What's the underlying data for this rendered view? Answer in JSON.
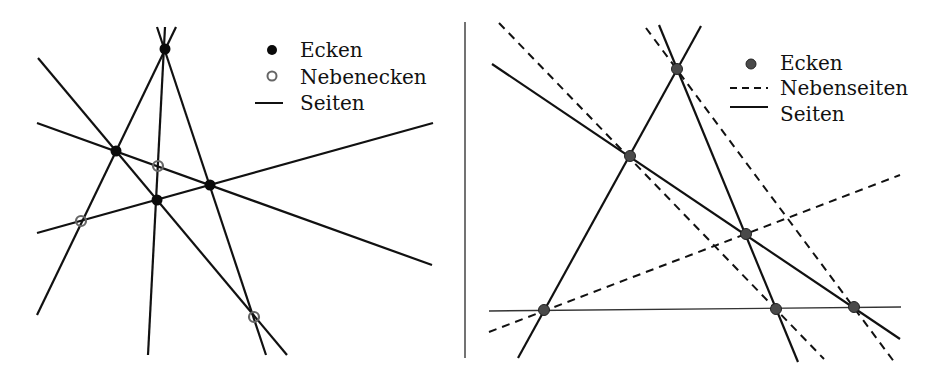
{
  "colors": {
    "line": "#111111",
    "vertex_fill_left": "#0a0a0a",
    "vertex_fill_right": "#4a4a4a",
    "vertex_stroke_right": "#222222",
    "secondary_vertex_stroke": "#666666",
    "separator": "#444444",
    "background": "#ffffff"
  },
  "left_panel": {
    "legend": {
      "items": [
        {
          "symbol": "filled-dot",
          "label": "Ecken"
        },
        {
          "symbol": "open-circle",
          "label": "Nebenecken"
        },
        {
          "symbol": "solid-line",
          "label": "Seiten"
        }
      ]
    },
    "lines": [
      {
        "x1": 38,
        "y1": 58,
        "x2": 287,
        "y2": 355,
        "style": "solid"
      },
      {
        "x1": 37,
        "y1": 123,
        "x2": 432,
        "y2": 265,
        "style": "solid"
      },
      {
        "x1": 37,
        "y1": 233,
        "x2": 433,
        "y2": 123,
        "style": "solid"
      },
      {
        "x1": 37,
        "y1": 315,
        "x2": 176,
        "y2": 27,
        "style": "solid"
      },
      {
        "x1": 148,
        "y1": 355,
        "x2": 165,
        "y2": 27,
        "style": "solid"
      },
      {
        "x1": 157,
        "y1": 27,
        "x2": 266,
        "y2": 355,
        "style": "solid"
      }
    ],
    "vertices": [
      {
        "x": 165,
        "y": 49
      },
      {
        "x": 116,
        "y": 151
      },
      {
        "x": 157,
        "y": 200
      },
      {
        "x": 210,
        "y": 185
      }
    ],
    "secondary_vertices": [
      {
        "x": 158,
        "y": 166
      },
      {
        "x": 81,
        "y": 221
      },
      {
        "x": 254,
        "y": 317
      }
    ]
  },
  "right_panel": {
    "legend": {
      "items": [
        {
          "symbol": "filled-dot",
          "label": "Ecken"
        },
        {
          "symbol": "dashed-line",
          "label": "Nebenseiten"
        },
        {
          "symbol": "solid-line",
          "label": "Seiten"
        }
      ]
    },
    "lines": [
      {
        "x1": 489,
        "y1": 311,
        "x2": 901,
        "y2": 307,
        "style": "solid-thin"
      },
      {
        "x1": 518,
        "y1": 358,
        "x2": 701,
        "y2": 26,
        "style": "solid"
      },
      {
        "x1": 659,
        "y1": 25,
        "x2": 798,
        "y2": 362,
        "style": "solid"
      },
      {
        "x1": 492,
        "y1": 64,
        "x2": 900,
        "y2": 339,
        "style": "solid"
      }
    ],
    "dashed_lines": [
      {
        "x1": 499,
        "y1": 23,
        "x2": 824,
        "y2": 359
      },
      {
        "x1": 646,
        "y1": 28,
        "x2": 895,
        "y2": 363
      },
      {
        "x1": 489,
        "y1": 332,
        "x2": 900,
        "y2": 175
      }
    ],
    "vertices": [
      {
        "x": 677,
        "y": 69
      },
      {
        "x": 630,
        "y": 156
      },
      {
        "x": 746,
        "y": 234
      },
      {
        "x": 544,
        "y": 310
      },
      {
        "x": 776,
        "y": 309
      },
      {
        "x": 854,
        "y": 307
      }
    ]
  },
  "separator": {
    "x": 465,
    "y1": 22,
    "y2": 358
  }
}
